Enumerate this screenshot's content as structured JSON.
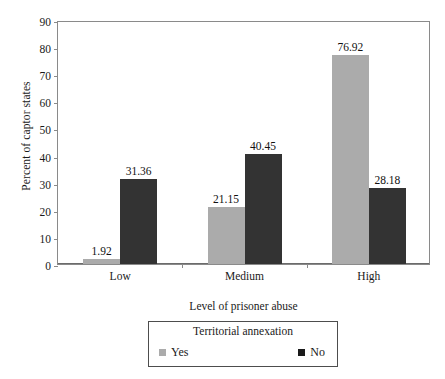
{
  "chart_data": {
    "type": "bar",
    "title": "",
    "xlabel": "Level of prisoner abuse",
    "ylabel": "Percent of captor states",
    "categories": [
      "Low",
      "Medium",
      "High"
    ],
    "series": [
      {
        "name": "Yes",
        "values": [
          1.92,
          21.15,
          76.92
        ],
        "color": "#ababab"
      },
      {
        "name": "No",
        "values": [
          31.36,
          40.45,
          28.18
        ],
        "color": "#333333"
      }
    ],
    "value_labels": [
      [
        "1.92",
        "21.15",
        "76.92"
      ],
      [
        "31.36",
        "40.45",
        "28.18"
      ]
    ],
    "ylim": [
      0,
      90
    ],
    "yticks": [
      0,
      10,
      20,
      30,
      40,
      50,
      60,
      70,
      80,
      90
    ],
    "ytick_labels": [
      "0",
      "10",
      "20",
      "30",
      "40",
      "50",
      "60",
      "70",
      "80",
      "90"
    ],
    "grid": false,
    "legend": {
      "title": "Territorial annexation",
      "position": "bottom-outside",
      "entries": [
        {
          "label": "Yes",
          "color": "#ababab"
        },
        {
          "label": "No",
          "color": "#1a1a1a"
        }
      ]
    }
  }
}
